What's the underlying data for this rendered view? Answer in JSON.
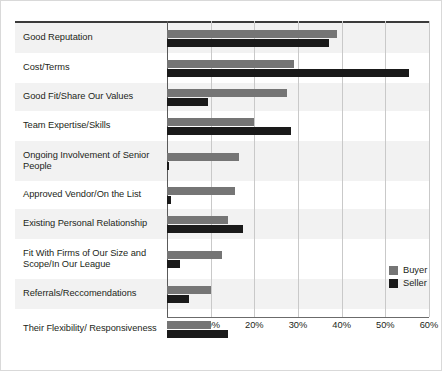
{
  "chart_data": {
    "type": "bar",
    "orientation": "horizontal",
    "title": "",
    "xlabel": "",
    "ylabel": "",
    "xlim": [
      0,
      60
    ],
    "xticks": [
      "0%",
      "10%",
      "20%",
      "30%",
      "40%",
      "50%",
      "60%"
    ],
    "xtick_values": [
      0,
      10,
      20,
      30,
      40,
      50,
      60
    ],
    "grid": true,
    "legend_position": "right",
    "categories": [
      "Good Reputation",
      "Cost/Terms",
      "Good Fit/Share Our Values",
      "Team Expertise/Skills",
      "Ongoing Involvement of Senior People",
      "Approved Vendor/On the List",
      "Existing Personal Relationship",
      "Fit With Firms of Our Size and Scope/In Our League",
      "Referrals/Reccomendations",
      "Their Flexibility/ Responsiveness"
    ],
    "series": [
      {
        "name": "Buyer",
        "color": "#757575",
        "values": [
          39,
          29,
          27.5,
          20,
          16.5,
          15.5,
          14,
          12.5,
          10,
          10
        ]
      },
      {
        "name": "Seller",
        "color": "#1a1a1a",
        "values": [
          37,
          55.5,
          9.5,
          28.5,
          0.5,
          1,
          17.5,
          3,
          5,
          14
        ]
      }
    ]
  },
  "legend": {
    "items": [
      {
        "label": "Buyer"
      },
      {
        "label": "Seller"
      }
    ]
  }
}
